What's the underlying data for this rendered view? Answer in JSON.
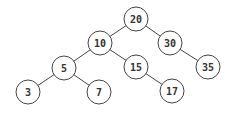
{
  "diagram": {
    "type": "binary-search-tree",
    "nodes": [
      {
        "id": "n20",
        "label": "20",
        "x": 136,
        "y": 19
      },
      {
        "id": "n10",
        "label": "10",
        "x": 100,
        "y": 43
      },
      {
        "id": "n30",
        "label": "30",
        "x": 170,
        "y": 43
      },
      {
        "id": "n5",
        "label": "5",
        "x": 64,
        "y": 68
      },
      {
        "id": "n15",
        "label": "15",
        "x": 136,
        "y": 67
      },
      {
        "id": "n35",
        "label": "35",
        "x": 208,
        "y": 67
      },
      {
        "id": "n3",
        "label": "3",
        "x": 28,
        "y": 92
      },
      {
        "id": "n7",
        "label": "7",
        "x": 99,
        "y": 92
      },
      {
        "id": "n17",
        "label": "17",
        "x": 172,
        "y": 91
      }
    ],
    "edges": [
      [
        "n20",
        "n10"
      ],
      [
        "n20",
        "n30"
      ],
      [
        "n10",
        "n5"
      ],
      [
        "n10",
        "n15"
      ],
      [
        "n30",
        "n35"
      ],
      [
        "n5",
        "n3"
      ],
      [
        "n5",
        "n7"
      ],
      [
        "n15",
        "n17"
      ]
    ],
    "node_radius": 12,
    "colors": {
      "stroke": "#444444",
      "fill": "#ffffff",
      "text": "#333333"
    }
  }
}
